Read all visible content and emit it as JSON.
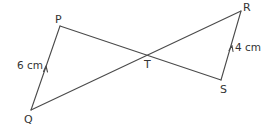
{
  "diagram": {
    "type": "geometry",
    "colors": {
      "line": "#4a4a4a",
      "text": "#333333",
      "background": "#ffffff"
    },
    "points": {
      "P": {
        "label": "P",
        "x": 60,
        "y": 26
      },
      "Q": {
        "label": "Q",
        "x": 31,
        "y": 110
      },
      "R": {
        "label": "R",
        "x": 241,
        "y": 11
      },
      "S": {
        "label": "S",
        "x": 221,
        "y": 80
      },
      "T": {
        "label": "T",
        "x": 148,
        "y": 55
      }
    },
    "segments": [
      {
        "from": "Q",
        "to": "P",
        "parallel_arrow": true
      },
      {
        "from": "P",
        "to": "S",
        "parallel_arrow": false
      },
      {
        "from": "Q",
        "to": "R",
        "parallel_arrow": false
      },
      {
        "from": "S",
        "to": "R",
        "parallel_arrow": true
      }
    ],
    "measurements": {
      "PQ": "6 cm",
      "RS": "4 cm"
    }
  }
}
